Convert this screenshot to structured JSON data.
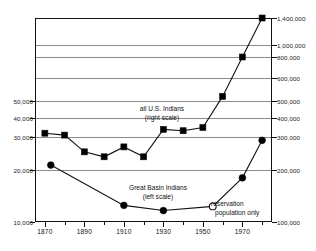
{
  "chart_data": {
    "type": "line",
    "title": "",
    "subtitle": "",
    "xlabel": "",
    "ylabel": "",
    "xlim": [
      1865,
      1985
    ],
    "grid": true,
    "legend": "inline-annotations",
    "x_ticks_major": [
      1870,
      1890,
      1910,
      1930,
      1950,
      1970
    ],
    "x_ticks_minor": [
      1880,
      1900,
      1920,
      1940,
      1960,
      1980
    ],
    "x_tick_labels": [
      "1870",
      "1890",
      "1910",
      "1930",
      "1950",
      "1970"
    ],
    "left_axis": {
      "name": "Great Basin Indians",
      "ylim": [
        10000,
        55000
      ],
      "tick_values": [
        10000,
        20000,
        30000,
        40000,
        50000
      ],
      "tick_labels": [
        "10,000",
        "20,000",
        "30,000",
        "40,000",
        "50,000"
      ]
    },
    "right_axis": {
      "name": "all U.S. Indians",
      "ylim": [
        100000,
        1400000
      ],
      "tick_values": [
        100000,
        200000,
        300000,
        400000,
        500000,
        600000,
        800000,
        1000000,
        1400000
      ],
      "tick_labels": [
        "100,000",
        "200,000",
        "300,000",
        "400,000",
        "500,000",
        "600,000",
        "800,000",
        "1,000,000",
        "1,400,000"
      ]
    },
    "series": [
      {
        "name": "all U.S. Indians",
        "scale": "right",
        "marker": "filled-square",
        "x": [
          1870,
          1880,
          1890,
          1900,
          1910,
          1920,
          1930,
          1940,
          1950,
          1960,
          1970,
          1980
        ],
        "values": [
          320000,
          310000,
          255000,
          240000,
          270000,
          240000,
          340000,
          333000,
          350000,
          520000,
          800000,
          1400000
        ]
      },
      {
        "name": "Great Basin Indians",
        "scale": "left",
        "marker": "filled-circle",
        "x": [
          1873,
          1910,
          1930,
          1955,
          1970,
          1980
        ],
        "values": [
          21500,
          13200,
          12200,
          13000,
          18500,
          29000
        ],
        "open_marker_index": 3
      }
    ],
    "annotations": [
      {
        "id": "all-us-indians",
        "text_line1": "all U.S. Indians",
        "text_line2": "(right scale)"
      },
      {
        "id": "great-basin-indians",
        "text_line1": "Great Basin Indians",
        "text_line2": "(left scale)"
      },
      {
        "id": "reservation-note",
        "text_line1": "reservation",
        "text_line2": "population only"
      }
    ],
    "colors": {
      "axis": "#111111",
      "grid": "#8a8a8a",
      "series_line": "#111111",
      "marker_fill": "#000000",
      "marker_open_fill": "#ffffff",
      "background": "#ffffff"
    }
  }
}
